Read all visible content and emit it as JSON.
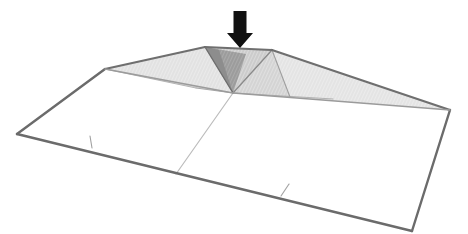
{
  "figure": {
    "background_color": "#ffffff",
    "width": 468,
    "height": 234
  },
  "colors": {
    "outline_dark": "#5a5a5a",
    "outline_mid": "#808080",
    "crease_light": "#b9b9b9",
    "crease_faint": "#cfcfcf",
    "face_flat": "#ffffff",
    "face_light": "#e4e4e4",
    "face_mid": "#d2d2d2",
    "face_dark": "#9a9a9a",
    "face_darkest": "#8c8c8c",
    "arrow_fill": "#111111"
  },
  "load_arrow": {
    "name": "point-load-arrow",
    "direction": "down",
    "shaft_x": 240,
    "shaft_top_y": 11,
    "shaft_width": 13,
    "shaft_bottom_y": 33,
    "head_half_width": 13,
    "tip_y": 48,
    "fill": "#111111"
  },
  "geometry": {
    "description": "Flat rectangular sheet in perspective with a raised central fold ridge",
    "sheet_corners": {
      "left": [
        17,
        134
      ],
      "top_left": [
        105,
        69
      ],
      "ridge_left": [
        205,
        47
      ],
      "ridge_right": [
        272,
        50
      ],
      "right": [
        450,
        110
      ],
      "bottom_right": [
        412,
        231
      ],
      "bottom_left_mid": [
        176,
        174
      ]
    },
    "node": [
      233,
      93
    ],
    "faces": [
      {
        "name": "flat-panel-left",
        "tone": "face_flat",
        "points": "17,134 105,69 233,93 176,174"
      },
      {
        "name": "flat-panel-right",
        "tone": "face_flat",
        "points": "176,174 233,93 450,110 412,231"
      },
      {
        "name": "wing-left-upper",
        "tone": "face_light",
        "points": "105,69 205,47 233,93"
      },
      {
        "name": "wing-left-lower",
        "tone": "face_mid",
        "points": "105,69 233,93 196,88"
      },
      {
        "name": "ridge-top-facet",
        "tone": "face_mid",
        "points": "205,47 272,50 233,93"
      },
      {
        "name": "ridge-dark-facet",
        "tone": "face_dark",
        "points": "205,47 244,53 233,93"
      },
      {
        "name": "ridge-darkest-sliver",
        "tone": "face_darkest",
        "points": "205,47 218,50 233,93"
      },
      {
        "name": "wing-right-upper",
        "tone": "face_light",
        "points": "272,50 450,110 233,93"
      },
      {
        "name": "wing-right-lower",
        "tone": "face_mid",
        "points": "272,50 333,99 233,93"
      }
    ],
    "creases": [
      {
        "name": "crease-node-to-bottom",
        "from": [
          233,
          93
        ],
        "to": [
          176,
          174
        ],
        "tone": "crease_light"
      },
      {
        "name": "crease-node-to-ridge-left",
        "from": [
          233,
          93
        ],
        "to": [
          205,
          47
        ],
        "tone": "outline_mid"
      },
      {
        "name": "crease-node-to-ridge-right",
        "from": [
          233,
          93
        ],
        "to": [
          272,
          50
        ],
        "tone": "outline_mid"
      },
      {
        "name": "crease-node-to-left-fan",
        "from": [
          233,
          93
        ],
        "to": [
          196,
          88
        ],
        "tone": "crease_light"
      },
      {
        "name": "crease-node-to-right-fan",
        "from": [
          233,
          93
        ],
        "to": [
          333,
          99
        ],
        "tone": "crease_light"
      },
      {
        "name": "crease-ridge-right-fan",
        "from": [
          272,
          50
        ],
        "to": [
          290,
          97
        ],
        "tone": "crease_light"
      }
    ],
    "tick_marks": [
      {
        "name": "tick-mark-left-edge",
        "from": [
          90,
          136
        ],
        "to": [
          92,
          148
        ]
      },
      {
        "name": "tick-mark-right-edge",
        "from": [
          289,
          184
        ],
        "to": [
          281,
          196
        ]
      }
    ]
  },
  "labels": {
    "caption": ""
  }
}
